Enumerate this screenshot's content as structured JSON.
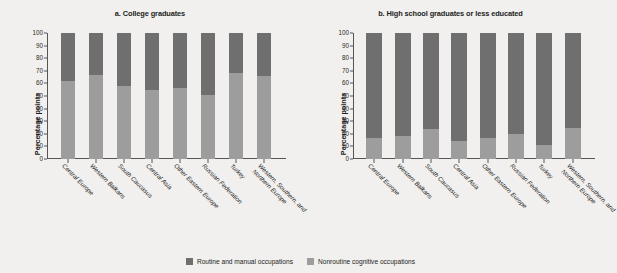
{
  "chart_data": {
    "type": "bar",
    "subtype": "stacked-100-percent",
    "title": "",
    "ylabel": "Percentage points",
    "xlabel": "",
    "ylim": [
      0,
      100
    ],
    "yticks": [
      100,
      90,
      80,
      70,
      60,
      50,
      40,
      30,
      20,
      10,
      0
    ],
    "grid": false,
    "legend_position": "bottom-center",
    "legend": [
      {
        "name": "Routine and manual occupations",
        "color": "#6f6f6f"
      },
      {
        "name": "Nonroutine cognitive occupations",
        "color": "#9d9d9d"
      }
    ],
    "categories": [
      "Central Europe",
      "Western Balkans",
      "South Caucasus",
      "Central Asia",
      "Other Eastern Europe",
      "Russian Federation",
      "Turkey",
      "Western, Southern, and Northern Europe"
    ],
    "panels": [
      {
        "id": "a",
        "title": "a. College graduates",
        "ylabel": "Percentage points",
        "series": [
          {
            "name": "Nonroutine cognitive occupations",
            "color": "#9d9d9d",
            "values": [
              62,
              67,
              58,
              55,
              56,
              51,
              68,
              66
            ]
          },
          {
            "name": "Routine and manual occupations",
            "color": "#6f6f6f",
            "values": [
              38,
              33,
              42,
              45,
              44,
              49,
              32,
              34
            ]
          }
        ]
      },
      {
        "id": "b",
        "title": "b. High school graduates or less educated",
        "ylabel": "Percentage points",
        "series": [
          {
            "name": "Nonroutine cognitive occupations",
            "color": "#9d9d9d",
            "values": [
              17,
              18,
              24,
              14,
              17,
              20,
              11,
              25
            ]
          },
          {
            "name": "Routine and manual occupations",
            "color": "#6f6f6f",
            "values": [
              83,
              82,
              76,
              86,
              83,
              80,
              89,
              75
            ]
          }
        ]
      }
    ]
  },
  "colors": {
    "routine_manual": "#6f6f6f",
    "nonroutine_cognitive": "#9d9d9d",
    "background": "#f1f0ee",
    "axis": "#555555"
  }
}
